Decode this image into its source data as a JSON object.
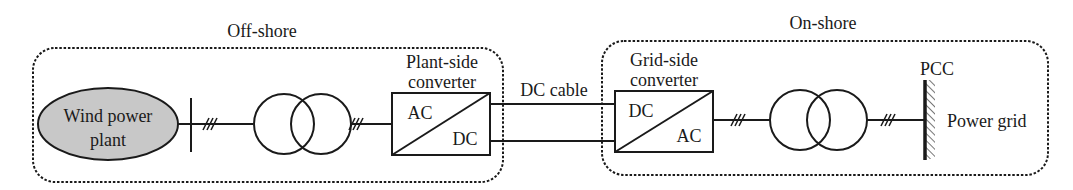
{
  "diagram": {
    "regions": {
      "offshore": {
        "label": "Off-shore"
      },
      "onshore": {
        "label": "On-shore"
      }
    },
    "source": {
      "line1": "Wind power",
      "line2": "plant",
      "fill": "#c8c8c8"
    },
    "plant_converter": {
      "title1": "Plant-side",
      "title2": "converter",
      "in": "AC",
      "out": "DC"
    },
    "dc_cable": {
      "label": "DC cable"
    },
    "grid_converter": {
      "title1": "Grid-side",
      "title2": "converter",
      "in": "DC",
      "out": "AC"
    },
    "pcc": {
      "label": "PCC"
    },
    "grid": {
      "label": "Power grid"
    },
    "colors": {
      "stroke": "#1a1a1a",
      "ellipse_fill": "#c8c8c8",
      "background": "#ffffff"
    }
  }
}
